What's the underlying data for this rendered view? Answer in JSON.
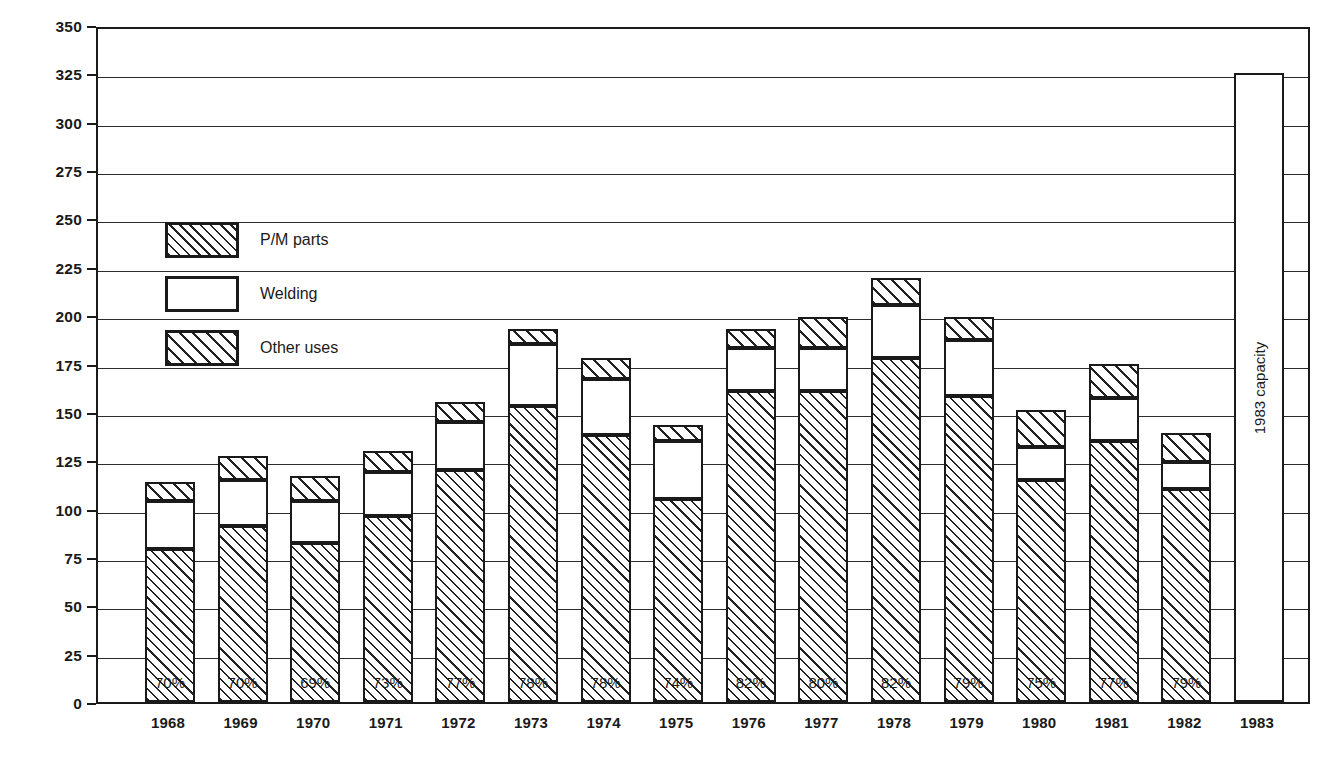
{
  "chart_data": {
    "type": "bar",
    "subtype": "stacked-vertical",
    "title": "",
    "xlabel": "",
    "ylabel": "Thousands of tons (2000 lb)",
    "ylim": [
      0,
      350
    ],
    "ytick_step": 25,
    "ytick_labels": [
      "0",
      "25",
      "50",
      "75",
      "100",
      "125",
      "150",
      "175",
      "200",
      "225",
      "250",
      "275",
      "300",
      "325",
      "350"
    ],
    "grid": true,
    "grid_axis": "y",
    "legend_position": "inside-upper-left",
    "categories": [
      "1968",
      "1969",
      "1970",
      "1971",
      "1972",
      "1973",
      "1974",
      "1975",
      "1976",
      "1977",
      "1978",
      "1979",
      "1980",
      "1981",
      "1982",
      "1983"
    ],
    "series": [
      {
        "name": "P/M parts",
        "values": [
          79,
          91,
          82,
          96,
          120,
          153,
          138,
          105,
          161,
          161,
          178,
          158,
          115,
          135,
          110,
          null
        ]
      },
      {
        "name": "Welding",
        "values": [
          25,
          24,
          22,
          23,
          25,
          32,
          29,
          30,
          22,
          22,
          27,
          29,
          17,
          22,
          14,
          null
        ]
      },
      {
        "name": "Other uses",
        "values": [
          10,
          12,
          13,
          11,
          10,
          8,
          11,
          8,
          10,
          16,
          14,
          12,
          19,
          18,
          15,
          null
        ]
      }
    ],
    "totals": [
      114,
      127,
      117,
      130,
      155,
      193,
      178,
      143,
      193,
      199,
      219,
      199,
      151,
      175,
      139,
      325
    ],
    "bar_annotations": [
      "70%",
      "70%",
      "69%",
      "73%",
      "77%",
      "78%",
      "78%",
      "74%",
      "82%",
      "80%",
      "82%",
      "79%",
      "75%",
      "77%",
      "79%",
      ""
    ],
    "annotation_note": "Percentage shown inside each bar is the P/M parts share of that year's total",
    "capacity_bar": {
      "category": "1983",
      "value": 325,
      "label": "1983 capacity",
      "filled": false
    }
  },
  "legend": {
    "items": [
      {
        "label": "P/M parts",
        "pattern": "hatch-dense"
      },
      {
        "label": "Welding",
        "pattern": "solid-white"
      },
      {
        "label": "Other uses",
        "pattern": "hatch-wide"
      }
    ]
  },
  "colors": {
    "ink": "#1a1a1a",
    "grid": "#2b2b2b",
    "background": "#ffffff"
  }
}
